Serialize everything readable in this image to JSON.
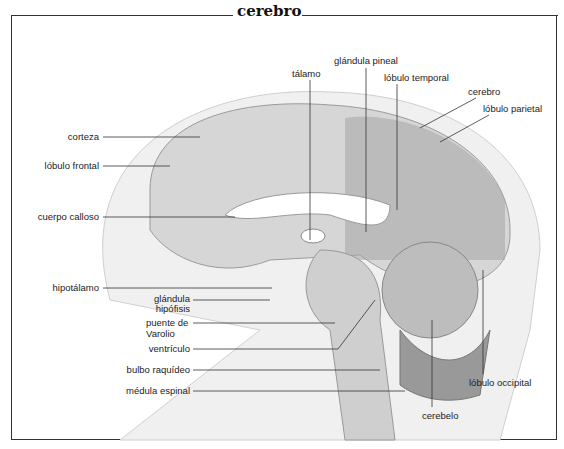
{
  "title": "cerebro",
  "labels": {
    "corteza": "corteza",
    "lobulo_frontal": "lóbulo frontal",
    "cuerpo_calloso": "cuerpo calloso",
    "hipotalamo": "hipotálamo",
    "glandula_hipofisis_1": "glándula",
    "glandula_hipofisis_2": "hipófisis",
    "puente_1": "puente de",
    "puente_2": "Varolio",
    "ventriculo": "ventrículo",
    "bulbo_raquideo": "bulbo raquídeo",
    "medula_espinal": "médula espinal",
    "talamo": "tálamo",
    "glandula_pineal": "glándula pineal",
    "lobulo_temporal": "lóbulo temporal",
    "cerebro": "cerebro",
    "lobulo_parietal": "lóbulo parietal",
    "lobulo_occipital": "lóbulo occipital",
    "cerebelo": "cerebelo"
  },
  "colors": {
    "line": "#333333",
    "tissue": "#d8d8d8",
    "dark": "#7a7a7a",
    "head": "#eeeeee"
  }
}
